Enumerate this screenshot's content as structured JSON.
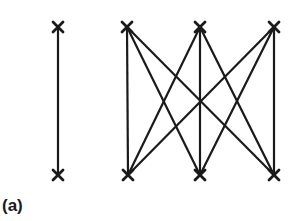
{
  "caption": "(a)",
  "colors": {
    "stroke": "#1a1a1a",
    "background": "#ffffff"
  },
  "graphs": [
    {
      "name": "K2",
      "nodes": [
        {
          "id": "a1",
          "x": 58,
          "y": 27
        },
        {
          "id": "a2",
          "x": 58,
          "y": 175
        }
      ],
      "edges": [
        [
          "a1",
          "a2"
        ]
      ]
    },
    {
      "name": "K3,3",
      "nodes": [
        {
          "id": "t1",
          "x": 127,
          "y": 27
        },
        {
          "id": "t2",
          "x": 200,
          "y": 27
        },
        {
          "id": "t3",
          "x": 274,
          "y": 27
        },
        {
          "id": "b1",
          "x": 128,
          "y": 175
        },
        {
          "id": "b2",
          "x": 200,
          "y": 175
        },
        {
          "id": "b3",
          "x": 274,
          "y": 175
        }
      ],
      "edges": [
        [
          "t1",
          "b1"
        ],
        [
          "t1",
          "b2"
        ],
        [
          "t1",
          "b3"
        ],
        [
          "t2",
          "b1"
        ],
        [
          "t2",
          "b2"
        ],
        [
          "t2",
          "b3"
        ],
        [
          "t3",
          "b1"
        ],
        [
          "t3",
          "b2"
        ],
        [
          "t3",
          "b3"
        ]
      ]
    }
  ]
}
